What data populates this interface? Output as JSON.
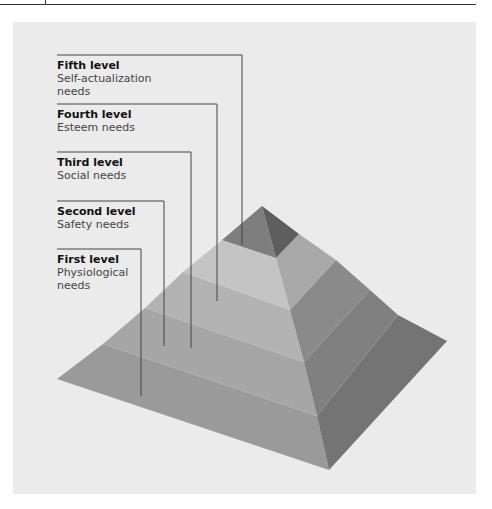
{
  "diagram": {
    "type": "pyramid",
    "levels": [
      {
        "level": 5,
        "title": "Fifth level",
        "description": "Self-actualization\nneeds",
        "color": "#7e7e7e"
      },
      {
        "level": 4,
        "title": "Fourth level",
        "description": "Esteem needs",
        "color": "#c4c4c4"
      },
      {
        "level": 3,
        "title": "Third level",
        "description": "Social needs",
        "color": "#b3b3b3"
      },
      {
        "level": 2,
        "title": "Second level",
        "description": "Safety needs",
        "color": "#a6a6a6"
      },
      {
        "level": 1,
        "title": "First level",
        "description": "Physiological\nneeds",
        "color": "#9a9a9a"
      }
    ]
  },
  "colors": {
    "panel_background": "#ebebeb",
    "leader_line": "#444444",
    "front_face_tones": [
      "#7e7e7e",
      "#c4c4c4",
      "#b3b3b3",
      "#a6a6a6",
      "#9a9a9a"
    ],
    "side_face_tones": [
      "#5e5e5e",
      "#a9a9a9",
      "#8a8a8a",
      "#808080",
      "#747474"
    ]
  },
  "labels": {
    "fifth": {
      "title": "Fifth level",
      "desc": "Self-actualization\nneeds"
    },
    "fourth": {
      "title": "Fourth level",
      "desc": "Esteem needs"
    },
    "third": {
      "title": "Third level",
      "desc": "Social needs"
    },
    "second": {
      "title": "Second level",
      "desc": "Safety needs"
    },
    "first": {
      "title": "First level",
      "desc": "Physiological\nneeds"
    }
  }
}
